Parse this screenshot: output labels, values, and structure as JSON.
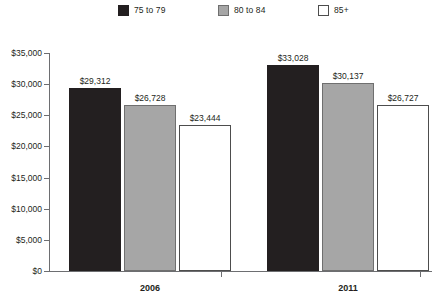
{
  "chart_data": {
    "type": "bar",
    "title": "",
    "subtitle": "",
    "xlabel": "",
    "ylabel": "",
    "categories": [
      "2006",
      "2011"
    ],
    "series": [
      {
        "name": "75 to 79",
        "color": "#231f20",
        "values": [
          29312,
          33028
        ],
        "labels": [
          "$29,312",
          "$33,028"
        ]
      },
      {
        "name": "80 to 84",
        "color": "#a6a6a6",
        "values": [
          26728,
          30137
        ],
        "labels": [
          "$26,728",
          "$30,137"
        ]
      },
      {
        "name": "85+",
        "color": "#ffffff",
        "values": [
          23444,
          26727
        ],
        "labels": [
          "$23,444",
          "$26,727"
        ]
      }
    ],
    "ylim": [
      0,
      35000
    ],
    "ytick_values": [
      0,
      5000,
      10000,
      15000,
      20000,
      25000,
      30000,
      35000
    ],
    "ytick_labels": [
      "$0",
      "$5,000",
      "$10,000",
      "$15,000",
      "$20,000",
      "$25,000",
      "$30,000",
      "$35,000"
    ],
    "grid": false,
    "legend_position": "top",
    "value_labels_shown": true
  },
  "legend": {
    "items": [
      {
        "label": "75 to 79",
        "swatch": "dark"
      },
      {
        "label": "80 to 84",
        "swatch": "gray"
      },
      {
        "label": "85+",
        "swatch": "white"
      }
    ]
  },
  "colors": {
    "series_75_79": "#231f20",
    "series_80_84": "#a6a6a6",
    "series_85_plus": "#ffffff",
    "axis": "#6d6e71",
    "text": "#231f20",
    "background": "#ffffff"
  }
}
